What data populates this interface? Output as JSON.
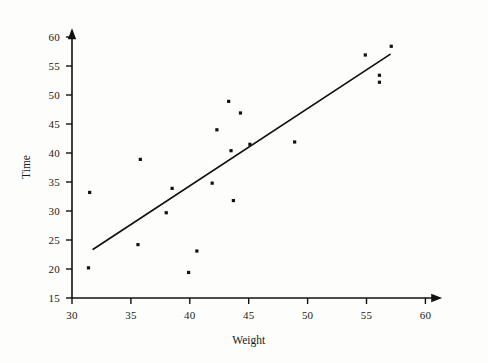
{
  "chart_data": {
    "type": "scatter",
    "title": "",
    "xlabel": "Weight",
    "ylabel": "Time",
    "xlim": [
      30,
      61
    ],
    "ylim": [
      15,
      61
    ],
    "xticks": [
      30,
      35,
      40,
      45,
      50,
      55,
      60
    ],
    "yticks": [
      15,
      20,
      25,
      30,
      35,
      40,
      45,
      50,
      55,
      60
    ],
    "grid": false,
    "legend": null,
    "marker": "square",
    "marker_color": "#111111",
    "axis_color": "#111111",
    "points": [
      {
        "x": 31.4,
        "y": 20.2
      },
      {
        "x": 31.5,
        "y": 33.2
      },
      {
        "x": 35.6,
        "y": 24.2
      },
      {
        "x": 35.8,
        "y": 38.9
      },
      {
        "x": 38.0,
        "y": 29.7
      },
      {
        "x": 38.5,
        "y": 33.9
      },
      {
        "x": 39.9,
        "y": 19.4
      },
      {
        "x": 40.6,
        "y": 23.1
      },
      {
        "x": 41.9,
        "y": 34.8
      },
      {
        "x": 42.3,
        "y": 44.0
      },
      {
        "x": 43.3,
        "y": 48.9
      },
      {
        "x": 43.5,
        "y": 40.4
      },
      {
        "x": 43.7,
        "y": 31.8
      },
      {
        "x": 44.3,
        "y": 46.9
      },
      {
        "x": 45.1,
        "y": 41.5
      },
      {
        "x": 48.9,
        "y": 41.9
      },
      {
        "x": 54.9,
        "y": 56.9
      },
      {
        "x": 56.1,
        "y": 53.4
      },
      {
        "x": 56.1,
        "y": 52.2
      },
      {
        "x": 57.1,
        "y": 58.4
      }
    ],
    "fit_line": {
      "type": "linear-regression",
      "x_start": 31.8,
      "y_start": 23.4,
      "x_end": 57.0,
      "y_end": 57.0,
      "color": "#111111"
    }
  }
}
